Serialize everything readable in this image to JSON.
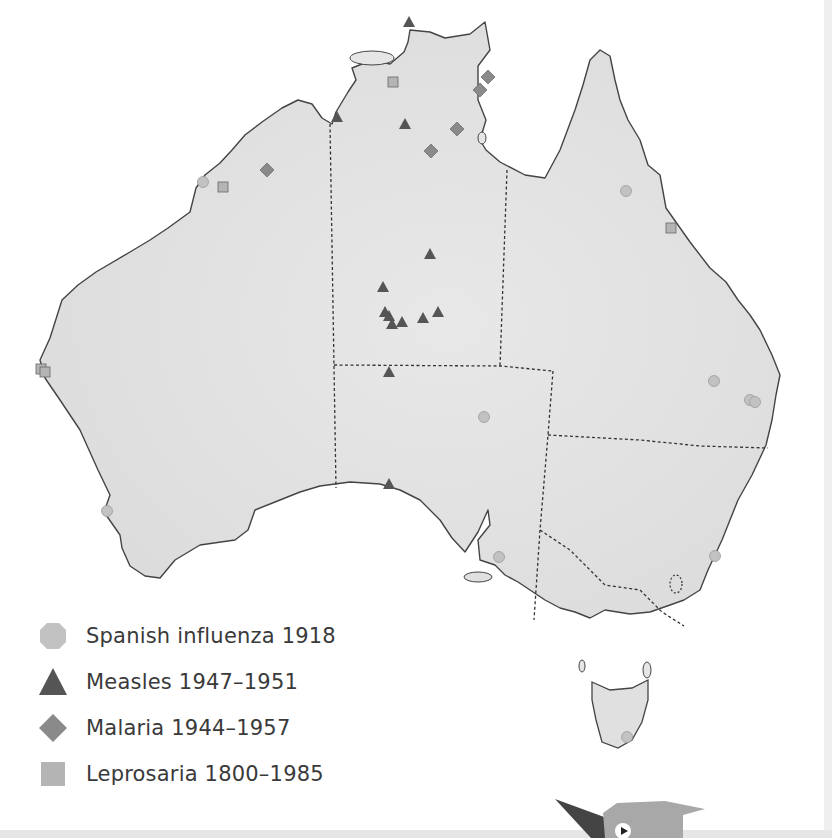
{
  "map": {
    "title": "",
    "region": "Australia",
    "land_color": "#e4e4e4",
    "coast_color": "#444444",
    "border_color": "#333333",
    "states": [
      "WA",
      "NT",
      "SA",
      "QLD",
      "NSW",
      "VIC",
      "TAS"
    ]
  },
  "legend": {
    "items": [
      {
        "key": "influenza",
        "label": "Spanish influenza 1918",
        "shape": "octagon",
        "color": "#c2c2c2"
      },
      {
        "key": "measles",
        "label": "Measles 1947–1951",
        "shape": "triangle",
        "color": "#5a5a5a"
      },
      {
        "key": "malaria",
        "label": "Malaria 1944–1957",
        "shape": "diamond",
        "color": "#8a8a8a"
      },
      {
        "key": "leprosaria",
        "label": "Leprosaria 1800–1985",
        "shape": "square",
        "color": "#b4b4b4"
      }
    ]
  },
  "markers": {
    "influenza": [
      [
        203,
        182
      ],
      [
        626,
        191
      ],
      [
        714,
        381
      ],
      [
        750,
        400
      ],
      [
        755,
        402
      ],
      [
        484,
        417
      ],
      [
        107,
        511
      ],
      [
        499,
        557
      ],
      [
        715,
        556
      ],
      [
        627,
        737
      ]
    ],
    "measles": [
      [
        409,
        22
      ],
      [
        337,
        117
      ],
      [
        405,
        124
      ],
      [
        430,
        254
      ],
      [
        383,
        287
      ],
      [
        385,
        312
      ],
      [
        389,
        316
      ],
      [
        392,
        324
      ],
      [
        402,
        322
      ],
      [
        423,
        318
      ],
      [
        438,
        312
      ],
      [
        389,
        372
      ],
      [
        389,
        484
      ]
    ],
    "malaria": [
      [
        488,
        77
      ],
      [
        480,
        90
      ],
      [
        457,
        129
      ],
      [
        431,
        151
      ],
      [
        267,
        170
      ]
    ],
    "leprosaria": [
      [
        393,
        82
      ],
      [
        223,
        187
      ],
      [
        671,
        228
      ],
      [
        41,
        369
      ],
      [
        45,
        372
      ]
    ]
  },
  "bird": {
    "label": "mascot-bird"
  }
}
